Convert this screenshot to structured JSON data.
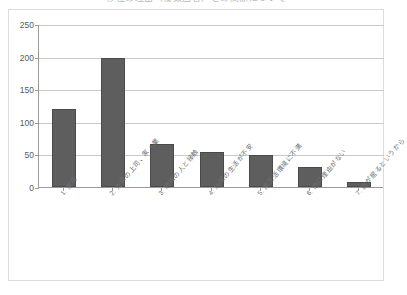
{
  "chart_data": {
    "type": "bar",
    "title": "移住の理由（複数回答）との関係について",
    "xlabel": "",
    "ylabel": "",
    "ylim": [
      0,
      250
    ],
    "ytick_labels": [
      "0",
      "50",
      "100",
      "150",
      "200",
      "250"
    ],
    "yticks": [
      0,
      50,
      100,
      150,
      200,
      250
    ],
    "grid": true,
    "legend": false,
    "categories": [
      "1. 家庭",
      "2. 先輩の上司、家・業",
      "3. 地域の人と接触",
      "4. 地域の生活が不安",
      "5. 厚生活環境に不満",
      "6. 他に理由がない",
      "7. 親が居るというから"
    ],
    "values": [
      120,
      198,
      66,
      53,
      49,
      31,
      8
    ],
    "bar_color": "#5e5e5e",
    "bar_edge_color": "#4a4a4a",
    "grid_color": "#c9c9c9",
    "axis_color": "#9a9a9a",
    "background_color": "#ffffff",
    "frame_color": "#dcdcdc"
  }
}
